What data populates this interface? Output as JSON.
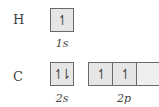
{
  "rows": [
    {
      "element": "H",
      "subshells": [
        {
          "label": "1s",
          "orbitals": [
            "↿"
          ]
        }
      ]
    },
    {
      "element": "C",
      "subshells": [
        {
          "label": "2s",
          "orbitals": [
            "↿⇂"
          ]
        },
        {
          "label": "2p",
          "orbitals": [
            "↿",
            "↿",
            ""
          ]
        }
      ]
    }
  ],
  "colors": {
    "box_fill": "#e6e6e6",
    "box_border": "#6a6a6a",
    "text": "#444444"
  }
}
